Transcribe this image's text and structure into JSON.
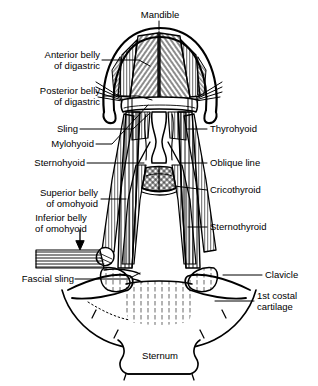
{
  "figure": {
    "background_color": "#ffffff",
    "ink_color": "#000000"
  },
  "labels": {
    "mandible": "Mandible",
    "anterior_belly_digastric": "Anterior belly\nof digastric",
    "posterior_belly_digastric": "Posterior belly\nof digastric",
    "sling": "Sling",
    "mylohyoid": "Mylohyoid",
    "sternohyoid": "Sternohyoid",
    "superior_belly_omohyoid": "Superior belly\nof omohyoid",
    "inferior_belly_omohyoid": "Inferior belly\nof omohyoid",
    "fascial_sling": "Fascial sling",
    "thyrohyoid": "Thyrohyoid",
    "oblique_line": "Oblique line",
    "cricothyroid": "Cricothyroid",
    "sternothyroid": "Sternothyroid",
    "clavicle": "Clavicle",
    "first_costal_cartilage": "1st costal\ncartilage",
    "sternum": "Sternum"
  },
  "label_lines": [
    {
      "name": "anterior-belly-of-digastric",
      "side": "left",
      "text_x": 18,
      "text_y": 54,
      "text_w": 82,
      "leader": "M 103,60 L 140,60 L 152,65"
    },
    {
      "name": "posterior-belly-of-digastric",
      "side": "left",
      "text_x": 10,
      "text_y": 90,
      "text_w": 90,
      "leader": "M 103,96 L 140,96 L 152,100"
    },
    {
      "name": "sling",
      "side": "left",
      "text_x": 42,
      "text_y": 124,
      "text_w": 58,
      "leader": "M 103,129 L 133,129 L 152,112"
    },
    {
      "name": "mylohyoid",
      "side": "left",
      "text_x": 40,
      "text_y": 139,
      "text_w": 60,
      "leader": "M 103,144 L 112,144 L 150,104"
    },
    {
      "name": "sternohyoid",
      "side": "left",
      "text_x": 30,
      "text_y": 158,
      "text_w": 70,
      "leader": "M 103,163 L 146,163"
    },
    {
      "name": "superior-belly-of-omohyoid",
      "side": "left",
      "text_x": 30,
      "text_y": 182,
      "text_w": 70,
      "leader": "M 103,199 L 128,199"
    },
    {
      "name": "inferior-belly-of-omohyoid",
      "side": "left",
      "text_x": 32,
      "text_y": 215,
      "text_w": 68,
      "leader": "M 80,232 L 80,248"
    },
    {
      "name": "fascial-sling",
      "side": "left",
      "text_x": 14,
      "text_y": 274,
      "text_w": 86,
      "leader": "M 103,279 L 134,279 L 142,272"
    },
    {
      "name": "thyrohyoid",
      "side": "right",
      "text_x": 208,
      "text_y": 124,
      "text_w": 90,
      "leader": "M 206,129 L 188,129"
    },
    {
      "name": "oblique-line",
      "side": "right",
      "text_x": 208,
      "text_y": 158,
      "text_w": 90,
      "leader": "M 206,163 L 180,163"
    },
    {
      "name": "cricothyroid",
      "side": "right",
      "text_x": 208,
      "text_y": 185,
      "text_w": 90,
      "leader": "M 206,190 L 172,186"
    },
    {
      "name": "sternothyroid",
      "side": "right",
      "text_x": 208,
      "text_y": 222,
      "text_w": 90,
      "leader": "M 206,227 L 186,227"
    },
    {
      "name": "clavicle",
      "side": "right",
      "text_x": 264,
      "text_y": 270,
      "text_w": 50,
      "leader": "M 261,275 L 224,275"
    },
    {
      "name": "first-costal-cartilage",
      "side": "right",
      "text_x": 258,
      "text_y": 296,
      "text_w": 58,
      "leader": "M 256,301 L 218,301"
    },
    {
      "name": "mandible",
      "side": "top",
      "text_x": 129,
      "text_y": 10,
      "text_w": 60,
      "leader": "M 159,21 L 159,30"
    },
    {
      "name": "sternum",
      "side": "bottom",
      "text_x": 131,
      "text_y": 350,
      "text_w": 56,
      "leader": ""
    }
  ],
  "structures": [
    {
      "name": "mandible-arch",
      "kind": "bone"
    },
    {
      "name": "mylohyoid-muscle",
      "kind": "muscle"
    },
    {
      "name": "digastric-anterior",
      "kind": "muscle"
    },
    {
      "name": "digastric-posterior",
      "kind": "muscle"
    },
    {
      "name": "hyoid-bone",
      "kind": "bone"
    },
    {
      "name": "thyrohyoid-muscle",
      "kind": "muscle"
    },
    {
      "name": "thyroid-cartilage",
      "kind": "cartilage"
    },
    {
      "name": "cricothyroid-muscle",
      "kind": "muscle"
    },
    {
      "name": "sternohyoid-muscle",
      "kind": "muscle"
    },
    {
      "name": "sternothyroid-muscle",
      "kind": "muscle"
    },
    {
      "name": "omohyoid-superior",
      "kind": "muscle"
    },
    {
      "name": "omohyoid-inferior",
      "kind": "muscle"
    },
    {
      "name": "fascial-sling-band",
      "kind": "fascia"
    },
    {
      "name": "clavicle-left",
      "kind": "bone"
    },
    {
      "name": "clavicle-right",
      "kind": "bone"
    },
    {
      "name": "sternum-body",
      "kind": "bone"
    },
    {
      "name": "costal-cartilage",
      "kind": "cartilage"
    },
    {
      "name": "trachea",
      "kind": "airway"
    }
  ]
}
